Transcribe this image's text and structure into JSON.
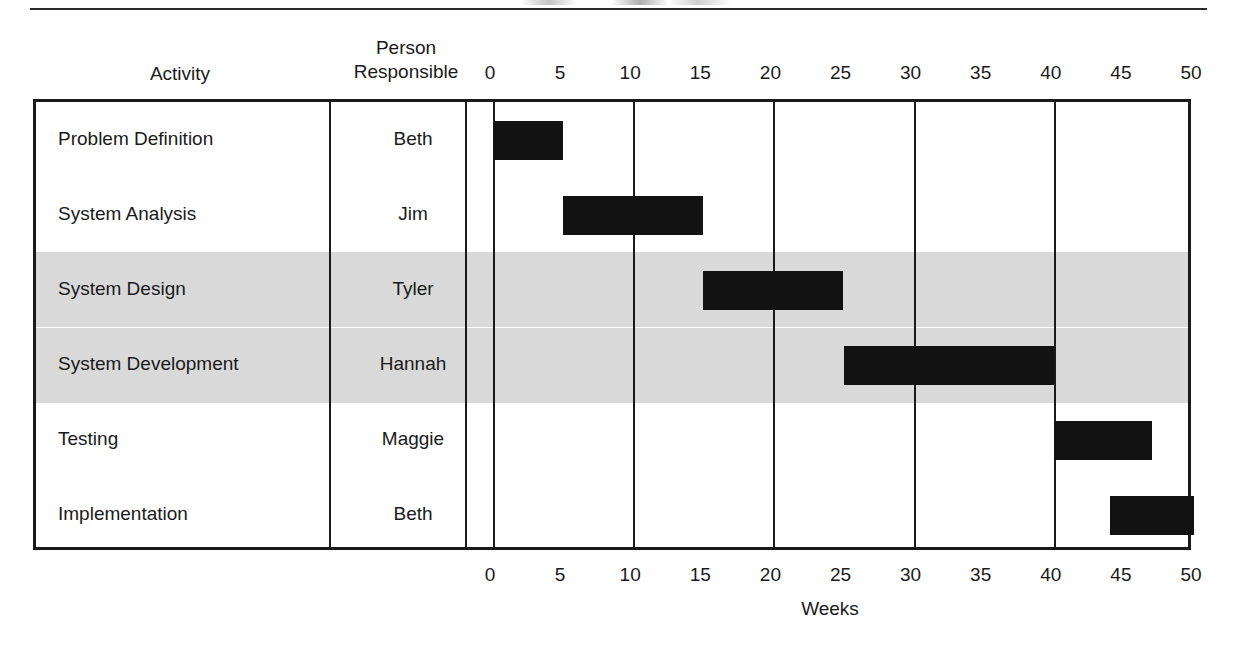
{
  "header": {
    "activity_label": "Activity",
    "person_label_line1": "Person",
    "person_label_line2": "Responsible"
  },
  "axis": {
    "title": "Weeks",
    "ticks": [
      0,
      5,
      10,
      15,
      20,
      25,
      30,
      35,
      40,
      45,
      50
    ],
    "gridlines": [
      0,
      10,
      20,
      30,
      40
    ],
    "min": 0,
    "max": 50
  },
  "style": {
    "bar_color": "#121212",
    "band_color": "#d9d9d9",
    "line_color": "#1a1a1a",
    "background": "#ffffff"
  },
  "rows": [
    {
      "activity": "Problem Definition",
      "person": "Beth",
      "start": 0,
      "end": 5,
      "shaded": false
    },
    {
      "activity": "System Analysis",
      "person": "Jim",
      "start": 5,
      "end": 15,
      "shaded": false
    },
    {
      "activity": "System Design",
      "person": "Tyler",
      "start": 15,
      "end": 25,
      "shaded": true
    },
    {
      "activity": "System Development",
      "person": "Hannah",
      "start": 25,
      "end": 40,
      "shaded": true
    },
    {
      "activity": "Testing",
      "person": "Maggie",
      "start": 40,
      "end": 47,
      "shaded": false
    },
    {
      "activity": "Implementation",
      "person": "Beth",
      "start": 44,
      "end": 50,
      "shaded": false
    }
  ],
  "chart_data": {
    "type": "bar",
    "title": "",
    "xlabel": "Weeks",
    "ylabel": "Activity",
    "xlim": [
      0,
      50
    ],
    "grid": true,
    "legend": "none",
    "categories": [
      "Problem Definition",
      "System Analysis",
      "System Design",
      "System Development",
      "Testing",
      "Implementation"
    ],
    "person_responsible": [
      "Beth",
      "Jim",
      "Tyler",
      "Hannah",
      "Maggie",
      "Beth"
    ],
    "bars": [
      {
        "category": "Problem Definition",
        "person": "Beth",
        "start": 0,
        "end": 5,
        "duration": 5
      },
      {
        "category": "System Analysis",
        "person": "Jim",
        "start": 5,
        "end": 15,
        "duration": 10
      },
      {
        "category": "System Design",
        "person": "Tyler",
        "start": 15,
        "end": 25,
        "duration": 10
      },
      {
        "category": "System Development",
        "person": "Hannah",
        "start": 25,
        "end": 40,
        "duration": 15
      },
      {
        "category": "Testing",
        "person": "Maggie",
        "start": 40,
        "end": 47,
        "duration": 7
      },
      {
        "category": "Implementation",
        "person": "Beth",
        "start": 44,
        "end": 50,
        "duration": 6
      }
    ],
    "xticks": [
      0,
      5,
      10,
      15,
      20,
      25,
      30,
      35,
      40,
      45,
      50
    ]
  }
}
